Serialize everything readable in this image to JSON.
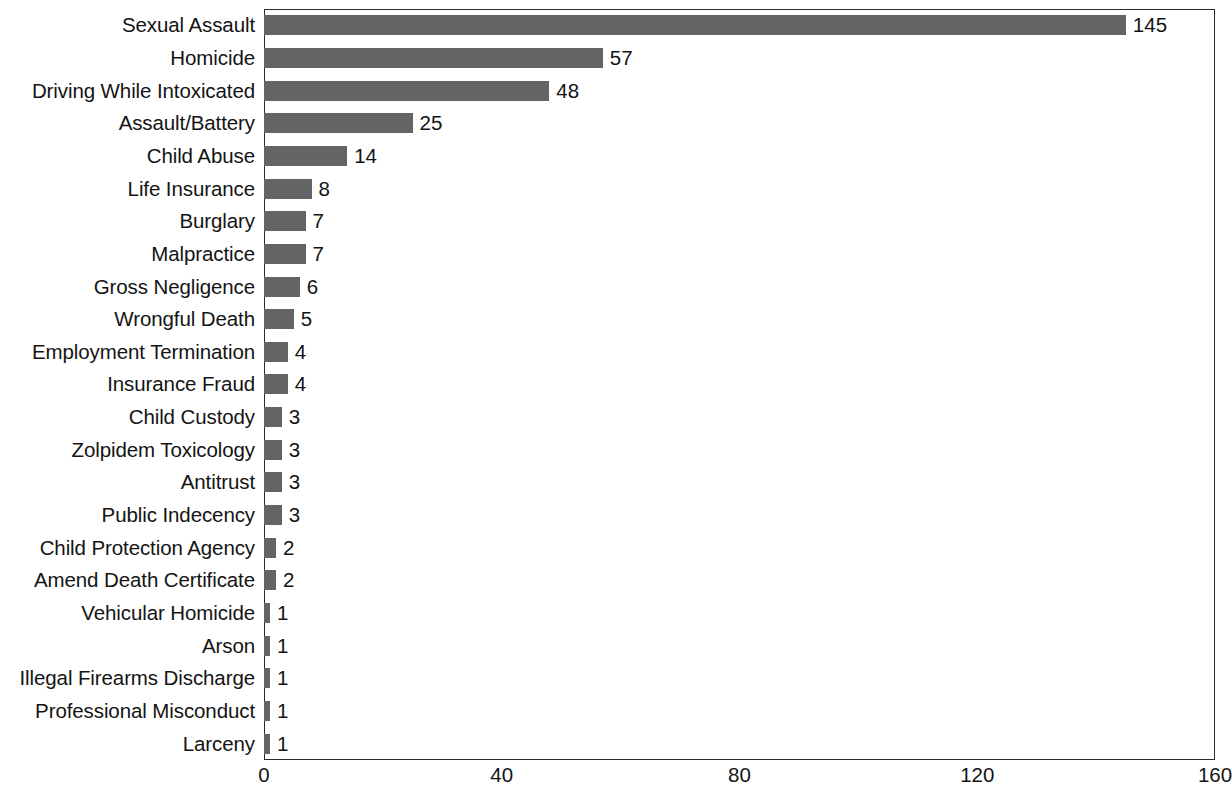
{
  "chart_data": {
    "type": "bar",
    "orientation": "horizontal",
    "title": "",
    "subtitle": "",
    "xlabel": "",
    "ylabel": "",
    "xlim": [
      0,
      160
    ],
    "ylim": null,
    "grid": false,
    "legend": null,
    "bar_color": "#646464",
    "axis_color": "#2b2b2b",
    "text_color": "#141414",
    "xticks": [
      0,
      40,
      80,
      120,
      160
    ],
    "xtick_labels": [
      "0",
      "40",
      "80",
      "120",
      "160"
    ],
    "categories": [
      "Sexual Assault",
      "Homicide",
      "Driving While Intoxicated",
      "Assault/Battery",
      "Child Abuse",
      "Life Insurance",
      "Burglary",
      "Malpractice",
      "Gross Negligence",
      "Wrongful Death",
      "Employment Termination",
      "Insurance Fraud",
      "Child Custody",
      "Zolpidem Toxicology",
      "Antitrust",
      "Public Indecency",
      "Child Protection Agency",
      "Amend Death Certificate",
      "Vehicular Homicide",
      "Arson",
      "Illegal Firearms Discharge",
      "Professional Misconduct",
      "Larceny"
    ],
    "values": [
      145,
      57,
      48,
      25,
      14,
      8,
      7,
      7,
      6,
      5,
      4,
      4,
      3,
      3,
      3,
      3,
      2,
      2,
      1,
      1,
      1,
      1,
      1
    ],
    "data_labels": [
      "145",
      "57",
      "48",
      "25",
      "14",
      "8",
      "7",
      "7",
      "6",
      "5",
      "4",
      "4",
      "3",
      "3",
      "3",
      "3",
      "2",
      "2",
      "1",
      "1",
      "1",
      "1",
      "1"
    ]
  },
  "caption": {
    "text": ""
  }
}
